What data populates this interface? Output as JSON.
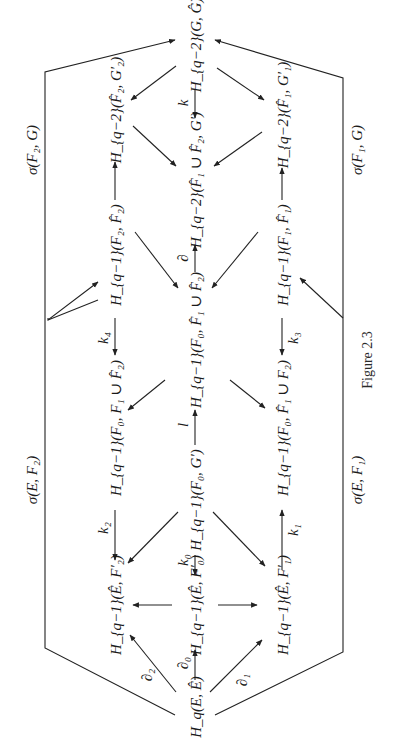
{
  "figure": {
    "caption": "Figure 2.3",
    "orientation": "rotated 90° counterclockwise",
    "nodes": {
      "hq_E_Ehat": "H_q(E, Ê)",
      "hq1_Ehat_F2p": "H_{q−1}(Ê, F′₂)",
      "hq1_Ehat_F0p": "H_{q−1}(Ê, F′₀)",
      "hq1_Ehat_F1p": "H_{q−1}(Ê, F′₁)",
      "hq1_F0_F1_F2hat": "H_{q−1}(F₀, F₁ ∪ F̂₂)",
      "hq1_F0_Gp": "H_{q−1}(F₀, G′)",
      "hq1_F0_F1hat_F2": "H_{q−1}(F₀, F̂₁ ∪ F₂)",
      "hq1_F2_F2hat": "H_{q−1}(F₂, F̂₂)",
      "hq1_F0_F1hat_F2hat": "H_{q−1}(F₀, F̂₁ ∪ F̂₂)",
      "hq1_F1_F1hat": "H_{q−1}(F₁, F̂₁)",
      "hq2_F2hat_G2p": "H_{q−2}(F̂₂, G′₂)",
      "hq2_F1hat_F2hat_Gp": "H_{q−2}(F̂₁ ∪ F̂₂, G′)",
      "hq2_F1hat_G1p": "H_{q−2}(F̂₁, G′₁)",
      "hq2_G_Ghat": "H_{q−2}(G, Ĝ)"
    },
    "arrow_labels": {
      "d2": "∂₂",
      "d0": "∂₀",
      "d1": "∂₁",
      "k2": "k₂",
      "k0": "k₀",
      "k1": "k₁",
      "l": "l",
      "k4": "k₄",
      "k3": "k₃",
      "d": "∂",
      "k": "k",
      "sigma_E_F2": "σ(E, F₂)",
      "sigma_E_F1": "σ(E, F₁)",
      "sigma_F2_G": "σ(F₂, G)",
      "sigma_F1_G": "σ(F₁, G)"
    }
  }
}
